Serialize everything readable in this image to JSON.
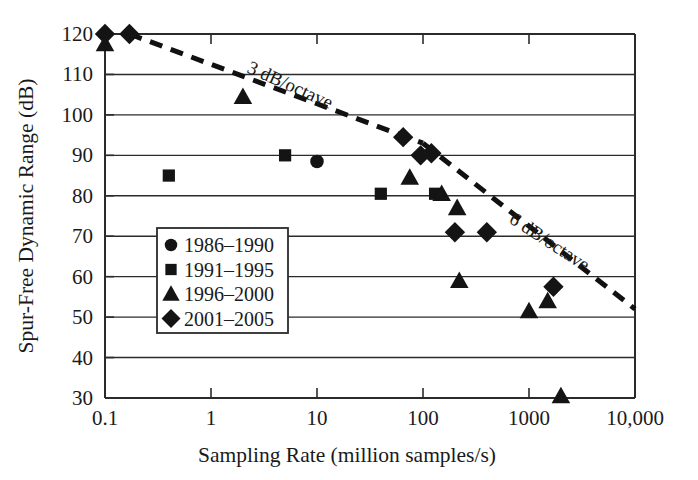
{
  "chart_data": {
    "type": "scatter",
    "title": "",
    "xlabel": "Sampling Rate (million samples/s)",
    "ylabel": "Spur-Free Dynamic Range (dB)",
    "xscale": "log",
    "yscale": "linear",
    "xlim": [
      0.1,
      10000
    ],
    "ylim": [
      30,
      120
    ],
    "grid": "horizontal",
    "xtick_labels": [
      "0.1",
      "1",
      "10",
      "100",
      "1000",
      "10,000"
    ],
    "xtick_values": [
      0.1,
      1,
      10,
      100,
      1000,
      10000
    ],
    "ytick_labels": [
      "30",
      "40",
      "50",
      "60",
      "70",
      "80",
      "90",
      "100",
      "110",
      "120"
    ],
    "ytick_values": [
      30,
      40,
      50,
      60,
      70,
      80,
      90,
      100,
      110,
      120
    ],
    "legend_position": "lower-left-inside",
    "series": [
      {
        "name": "1986–1990",
        "marker": "circle",
        "color": "#141414",
        "points": [
          {
            "x": 10,
            "y": 88.5
          }
        ]
      },
      {
        "name": "1991–1995",
        "marker": "square",
        "color": "#141414",
        "points": [
          {
            "x": 0.4,
            "y": 85
          },
          {
            "x": 5,
            "y": 90
          },
          {
            "x": 40,
            "y": 80.5
          },
          {
            "x": 130,
            "y": 80.5
          }
        ]
      },
      {
        "name": "1996–2000",
        "marker": "triangle",
        "color": "#141414",
        "points": [
          {
            "x": 0.1,
            "y": 117.5
          },
          {
            "x": 2,
            "y": 104.5
          },
          {
            "x": 75,
            "y": 84.5
          },
          {
            "x": 150,
            "y": 80.5
          },
          {
            "x": 210,
            "y": 77
          },
          {
            "x": 220,
            "y": 59
          },
          {
            "x": 1000,
            "y": 51.5
          },
          {
            "x": 1500,
            "y": 54
          },
          {
            "x": 2000,
            "y": 30.5
          }
        ]
      },
      {
        "name": "2001–2005",
        "marker": "diamond",
        "color": "#141414",
        "points": [
          {
            "x": 0.1,
            "y": 120
          },
          {
            "x": 0.17,
            "y": 120
          },
          {
            "x": 65,
            "y": 94.5
          },
          {
            "x": 95,
            "y": 90
          },
          {
            "x": 120,
            "y": 90.5
          },
          {
            "x": 200,
            "y": 71
          },
          {
            "x": 400,
            "y": 71
          },
          {
            "x": 1700,
            "y": 57.5
          }
        ]
      }
    ],
    "annotations": [
      {
        "text": "3 dB/octave",
        "kind": "trend-line-label",
        "line": {
          "from": {
            "x": 0.17,
            "y": 120
          },
          "to": {
            "x": 100,
            "y": 93
          },
          "style": "dashed",
          "slope_db_per_octave": 3
        }
      },
      {
        "text": "6 dB/octave",
        "kind": "trend-line-label",
        "line": {
          "from": {
            "x": 100,
            "y": 93
          },
          "to": {
            "x": 10000,
            "y": 52
          },
          "style": "dashed",
          "slope_db_per_octave": 6
        }
      }
    ]
  },
  "axes": {
    "x_title": "Sampling Rate (million samples/s)",
    "y_title": "Spur-Free Dynamic Range (dB)"
  },
  "legend": {
    "entries": [
      {
        "label": "1986–1990",
        "marker": "circle-marker"
      },
      {
        "label": "1991–1995",
        "marker": "square-marker"
      },
      {
        "label": "1996–2000",
        "marker": "triangle-marker"
      },
      {
        "label": "2001–2005",
        "marker": "diamond-marker"
      }
    ]
  },
  "trend_labels": {
    "upper": "3 dB/octave",
    "lower": "6 dB/octave"
  },
  "ticks": {
    "x": [
      "0.1",
      "1",
      "10",
      "100",
      "1000",
      "10,000"
    ],
    "y": [
      "120",
      "110",
      "100",
      "90",
      "80",
      "70",
      "60",
      "50",
      "40",
      "30"
    ]
  },
  "colors": {
    "marker": "#141414",
    "axis": "#2b2b2b",
    "background": "#ffffff"
  }
}
